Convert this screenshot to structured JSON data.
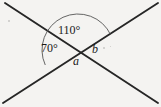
{
  "figure": {
    "type": "geometry-diagram",
    "background_color": "#f4f3f1",
    "stroke_color": "#262626",
    "arc_color": "#555555",
    "labels": {
      "angle_top": "110°",
      "angle_left": "70°",
      "angle_right": "b",
      "angle_bottom": "a"
    },
    "lines": [
      {
        "name": "line-descending",
        "from": {
          "x": 5,
          "y": 3
        },
        "to": {
          "x": 158,
          "y": 103
        }
      },
      {
        "name": "line-ascending",
        "from": {
          "x": 3,
          "y": 103
        },
        "to": {
          "x": 158,
          "y": 3
        }
      }
    ],
    "intersection": {
      "x": 78,
      "y": 50
    },
    "arc": {
      "name": "straight-angle-arc",
      "center": {
        "x": 78,
        "y": 50
      },
      "radius": 36,
      "start": {
        "x": 43,
        "y": 66
      },
      "end": {
        "x": 101,
        "y": 31
      }
    },
    "specks": [
      {
        "x": 8,
        "y": 20,
        "size": 2
      },
      {
        "x": 103,
        "y": 47,
        "size": 2
      },
      {
        "x": 110,
        "y": 46,
        "size": 1
      }
    ]
  }
}
